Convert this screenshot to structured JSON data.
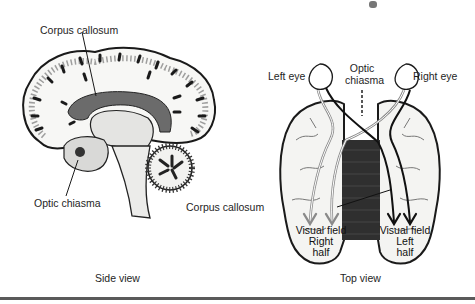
{
  "side_view": {
    "caption": "Side view",
    "labels": {
      "corpus_callosum": "Corpus callosum",
      "optic_chiasma": "Optic chiasma"
    }
  },
  "top_view": {
    "caption": "Top view",
    "labels": {
      "left_eye": "Left eye",
      "right_eye": "Right eye",
      "optic_chiasma_line1": "Optic",
      "optic_chiasma_line2": "chiasma",
      "corpus_callosum": "Corpus callosum"
    },
    "visual_fields": {
      "right": {
        "line1": "Visual field",
        "line2": "Right",
        "line3": "half"
      },
      "left": {
        "line1": "Visual field",
        "line2": "Left",
        "line3": "half"
      }
    }
  },
  "colors": {
    "corpus_callosum_fill": "#6b6b6b",
    "pathway_gray": "#8a8a8a",
    "pathway_black": "#111111",
    "outline": "#1a1a1a"
  }
}
